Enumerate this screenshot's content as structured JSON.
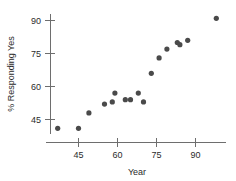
{
  "chart_data": {
    "type": "scatter",
    "title": "",
    "xlabel": "Year",
    "ylabel": "% Responding Yes",
    "xlim": [
      36,
      102
    ],
    "ylim": [
      38,
      95
    ],
    "xticks": [
      45,
      60,
      75,
      90
    ],
    "xticklabels": [
      "45",
      "60",
      "75",
      "90"
    ],
    "yticks": [
      45,
      60,
      75,
      90
    ],
    "yticklabels": [
      "45",
      "60",
      "75",
      "90"
    ],
    "grid": false,
    "legend": null,
    "marker_color": "#4a4a4a",
    "axis_color": "#6e6e6e",
    "points": [
      {
        "x": 37,
        "y": 41
      },
      {
        "x": 45,
        "y": 41
      },
      {
        "x": 49,
        "y": 48
      },
      {
        "x": 55,
        "y": 52
      },
      {
        "x": 58,
        "y": 53
      },
      {
        "x": 59,
        "y": 57
      },
      {
        "x": 63,
        "y": 54
      },
      {
        "x": 65,
        "y": 54
      },
      {
        "x": 68,
        "y": 57
      },
      {
        "x": 70,
        "y": 53
      },
      {
        "x": 73,
        "y": 66
      },
      {
        "x": 76,
        "y": 73
      },
      {
        "x": 79,
        "y": 77
      },
      {
        "x": 83,
        "y": 80
      },
      {
        "x": 84,
        "y": 79
      },
      {
        "x": 87,
        "y": 81
      },
      {
        "x": 98,
        "y": 91
      }
    ]
  },
  "axis": {
    "x_title": "Year",
    "y_title": "% Responding Yes",
    "x_tick_labels": [
      "45",
      "60",
      "75",
      "90"
    ],
    "y_tick_labels": [
      "90",
      "75",
      "60",
      "45"
    ]
  }
}
